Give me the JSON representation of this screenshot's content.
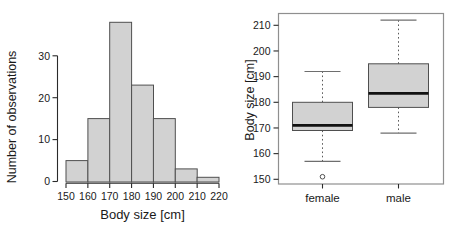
{
  "figure": {
    "background": "#ffffff",
    "text_color": "#1a1a1a",
    "axis_color": "#2a2a2a"
  },
  "chart_data": [
    {
      "type": "bar",
      "subtype": "histogram",
      "title": "",
      "xlabel": "Body size [cm]",
      "ylabel": "Number of observations",
      "bin_edges": [
        150,
        160,
        170,
        180,
        190,
        200,
        210,
        220
      ],
      "categories": [
        "150-160",
        "160-170",
        "170-180",
        "180-190",
        "190-200",
        "200-210",
        "210-220"
      ],
      "values": [
        5,
        15,
        38,
        23,
        15,
        3,
        1
      ],
      "x_ticks": [
        150,
        160,
        170,
        180,
        190,
        200,
        210,
        220
      ],
      "y_ticks": [
        0,
        10,
        20,
        30
      ],
      "xlim": [
        150,
        220
      ],
      "ylim": [
        0,
        38
      ],
      "grid": false,
      "bar_fill": "#d2d2d2",
      "bar_stroke": "#4f4f4f"
    },
    {
      "type": "boxplot",
      "title": "",
      "xlabel": "",
      "ylabel": "Body size [cm]",
      "categories": [
        "female",
        "male"
      ],
      "y_ticks": [
        150,
        160,
        170,
        180,
        190,
        200,
        210
      ],
      "ylim": [
        148,
        214
      ],
      "grid": false,
      "series": [
        {
          "name": "female",
          "lower_whisker": 157,
          "q1": 169,
          "median": 171,
          "q3": 180,
          "upper_whisker": 192,
          "outliers": [
            151
          ]
        },
        {
          "name": "male",
          "lower_whisker": 168,
          "q1": 178,
          "median": 183.5,
          "q3": 195,
          "upper_whisker": 212,
          "outliers": []
        }
      ],
      "box_fill": "#d2d2d2",
      "box_stroke": "#4f4f4f",
      "median_color": "#111111",
      "whisker_color": "#5a5a5a",
      "cap_color": "#6e6e6e",
      "frame_color": "#8f8f8f"
    }
  ]
}
